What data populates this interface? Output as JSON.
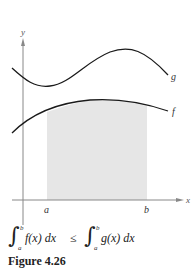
{
  "figure": {
    "caption": "Figure 4.26",
    "axis_labels": {
      "x": "x",
      "y": "y"
    },
    "bound_labels": {
      "a": "a",
      "b": "b"
    },
    "curve_labels": {
      "g": "g",
      "f": "f"
    },
    "colors": {
      "curve": "#1a1a1a",
      "axis": "#888888",
      "shade": "#e6e6e6",
      "text": "#222222"
    }
  },
  "formula": {
    "left_integral": {
      "lower": "a",
      "upper": "b",
      "integrand": "f(x) dx"
    },
    "relation": "≤",
    "right_integral": {
      "lower": "a",
      "upper": "b",
      "integrand": "g(x) dx"
    },
    "integral_sign": "∫"
  }
}
